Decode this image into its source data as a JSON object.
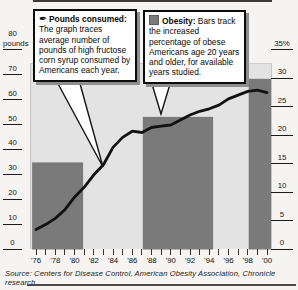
{
  "callouts": {
    "pounds": {
      "icon": "pen-icon",
      "icon_glyph": "✒",
      "title": "Pounds consumed:",
      "body": "The graph traces average number of pounds of high fructose corn syrup consumed by Americans each year."
    },
    "obesity": {
      "icon": "bar-swatch-icon",
      "title": "Obesity:",
      "body": "Bars track the increased percentage of obese Americans age 20 years and older, for available years studied."
    }
  },
  "source": "Source: Centers for Disease Control, American Obesity Association, Chronicle research",
  "colors": {
    "bar": "#7a7a7a",
    "plot_background": "#e3e3e3",
    "line": "#121212",
    "callout_shadow": "#8e8e8e"
  },
  "chart_data": {
    "type": "line+bar",
    "title": "",
    "x": [
      1976,
      1977,
      1978,
      1979,
      1980,
      1981,
      1982,
      1983,
      1984,
      1985,
      1986,
      1987,
      1988,
      1989,
      1990,
      1991,
      1992,
      1993,
      1994,
      1995,
      1996,
      1997,
      1998,
      1999,
      2000
    ],
    "series": [
      {
        "name": "Pounds consumed: pounds of high fructose corn syrup consumed per American each year",
        "type": "line",
        "axis": "left",
        "values": [
          8,
          10,
          12.5,
          16,
          21,
          25,
          30,
          34,
          41,
          45,
          47.5,
          47,
          49,
          49.5,
          50,
          52,
          54,
          55.5,
          56.5,
          58,
          60.5,
          62,
          63.5,
          64,
          63
        ]
      },
      {
        "name": "Obesity: percentage of obese Americans age 20 and older",
        "type": "bar",
        "axis": "right",
        "bars": [
          {
            "period": "1976-80",
            "from": 1975.6,
            "to": 1980.9,
            "value": 15.3
          },
          {
            "period": "1988-94",
            "from": 1987.1,
            "to": 1994.4,
            "value": 23.3
          },
          {
            "period": "1999-2000",
            "from": 1998.1,
            "to": 2000.5,
            "value": 30
          }
        ]
      }
    ],
    "left_axis": {
      "unit": "pounds",
      "range": [
        0,
        80
      ],
      "ticks": [
        80,
        70,
        60,
        50,
        40,
        30,
        20,
        10,
        0
      ]
    },
    "right_axis": {
      "unit": "%",
      "top_label": "35%",
      "range": [
        0,
        35
      ],
      "ticks": [
        35,
        30,
        25,
        20,
        15,
        10,
        5,
        0
      ]
    },
    "x_axis": {
      "tick_every_years": 1,
      "label_every_years": 2,
      "labels": [
        "'76",
        "'78",
        "'80",
        "'82",
        "'84",
        "'86",
        "'88",
        "'90",
        "'92",
        "'94",
        "'96",
        "'98",
        "'00"
      ]
    },
    "grid": false,
    "legend": "two callout boxes at top"
  }
}
